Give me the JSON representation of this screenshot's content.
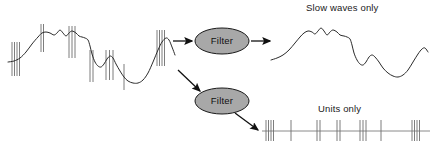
{
  "figure": {
    "width": 434,
    "height": 150,
    "background": "#ffffff",
    "title": ""
  },
  "colors": {
    "trace": "#2b2b2b",
    "spike": "#6e6e6e",
    "ellipse_fill": "#a8a8a8",
    "ellipse_stroke": "#1a1a1a",
    "arrow": "#111111",
    "text": "#1a1a1a",
    "baseline": "#8a8a8a"
  },
  "labels": {
    "slow_waves": "Slow waves only",
    "units": "Units only"
  },
  "nodes": [
    {
      "id": "filter-top",
      "label": "Filter",
      "cx": 222,
      "cy": 41,
      "rx": 27,
      "ry": 13
    },
    {
      "id": "filter-bottom",
      "label": "Filter",
      "cx": 222,
      "cy": 101,
      "rx": 27,
      "ry": 13
    }
  ],
  "arrows": [
    {
      "id": "input-to-filter-top",
      "x1": 173,
      "y1": 41,
      "x2": 192,
      "y2": 41
    },
    {
      "id": "filter-top-to-slow-waves",
      "x1": 251,
      "y1": 41,
      "x2": 270,
      "y2": 41
    },
    {
      "id": "input-to-filter-bottom",
      "x1": 178,
      "y1": 70,
      "x2": 200,
      "y2": 91
    },
    {
      "id": "filter-bottom-to-units",
      "x1": 235,
      "y1": 113,
      "x2": 258,
      "y2": 130
    }
  ],
  "chart_data": {
    "type": "line",
    "xlabel": "",
    "ylabel": "",
    "grid": false,
    "legend": "none",
    "panels": [
      {
        "id": "raw-signal",
        "name": "Raw signal (slow waves + units)",
        "x_range": [
          8,
          176
        ],
        "y_range": [
          18,
          90
        ],
        "trace_points": [
          [
            8,
            62
          ],
          [
            14,
            61
          ],
          [
            20,
            58
          ],
          [
            26,
            52
          ],
          [
            32,
            44
          ],
          [
            38,
            37
          ],
          [
            42,
            33
          ],
          [
            46,
            32
          ],
          [
            50,
            33
          ],
          [
            54,
            35
          ],
          [
            57,
            33
          ],
          [
            60,
            30
          ],
          [
            63,
            33
          ],
          [
            66,
            36
          ],
          [
            69,
            33
          ],
          [
            72,
            31
          ],
          [
            76,
            33
          ],
          [
            79,
            36
          ],
          [
            82,
            37
          ],
          [
            85,
            38
          ],
          [
            88,
            40
          ],
          [
            90,
            46
          ],
          [
            92,
            54
          ],
          [
            95,
            62
          ],
          [
            98,
            66
          ],
          [
            101,
            67
          ],
          [
            104,
            64
          ],
          [
            107,
            59
          ],
          [
            110,
            56
          ],
          [
            113,
            58
          ],
          [
            116,
            64
          ],
          [
            120,
            71
          ],
          [
            124,
            77
          ],
          [
            128,
            81
          ],
          [
            133,
            83
          ],
          [
            138,
            83
          ],
          [
            143,
            80
          ],
          [
            148,
            73
          ],
          [
            153,
            62
          ],
          [
            158,
            50
          ],
          [
            162,
            42
          ],
          [
            166,
            38
          ],
          [
            169,
            40
          ],
          [
            172,
            47
          ],
          [
            175,
            55
          ]
        ],
        "spike_bursts": [
          {
            "x": 12,
            "count": 4,
            "spacing": 2.5,
            "top": 42,
            "bottom": 76
          },
          {
            "x": 41,
            "count": 2,
            "spacing": 2.5,
            "top": 24,
            "bottom": 52
          },
          {
            "x": 69,
            "count": 3,
            "spacing": 3.0,
            "top": 26,
            "bottom": 58
          },
          {
            "x": 90,
            "count": 2,
            "spacing": 3.0,
            "top": 50,
            "bottom": 82
          },
          {
            "x": 106,
            "count": 3,
            "spacing": 3.5,
            "top": 50,
            "bottom": 80
          },
          {
            "x": 124,
            "count": 1,
            "spacing": 0,
            "top": 64,
            "bottom": 90
          },
          {
            "x": 157,
            "count": 4,
            "spacing": 2.5,
            "top": 30,
            "bottom": 66
          }
        ]
      },
      {
        "id": "slow-waves-output",
        "name": "Slow waves only",
        "x_range": [
          271,
          428
        ],
        "y_range": [
          22,
          76
        ],
        "trace_points": [
          [
            271,
            60
          ],
          [
            277,
            58
          ],
          [
            283,
            55
          ],
          [
            289,
            50
          ],
          [
            295,
            43
          ],
          [
            300,
            37
          ],
          [
            304,
            33
          ],
          [
            308,
            31
          ],
          [
            312,
            32
          ],
          [
            315,
            34
          ],
          [
            318,
            31
          ],
          [
            321,
            28
          ],
          [
            324,
            31
          ],
          [
            327,
            35
          ],
          [
            330,
            32
          ],
          [
            333,
            30
          ],
          [
            337,
            32
          ],
          [
            340,
            35
          ],
          [
            344,
            36
          ],
          [
            347,
            37
          ],
          [
            350,
            39
          ],
          [
            352,
            45
          ],
          [
            354,
            53
          ],
          [
            357,
            60
          ],
          [
            360,
            64
          ],
          [
            363,
            65
          ],
          [
            366,
            62
          ],
          [
            369,
            57
          ],
          [
            372,
            55
          ],
          [
            375,
            57
          ],
          [
            379,
            62
          ],
          [
            383,
            68
          ],
          [
            388,
            73
          ],
          [
            393,
            76
          ],
          [
            398,
            77
          ],
          [
            403,
            75
          ],
          [
            408,
            70
          ],
          [
            413,
            62
          ],
          [
            418,
            54
          ],
          [
            422,
            49
          ],
          [
            425,
            48
          ],
          [
            428,
            52
          ]
        ],
        "spike_bursts": []
      },
      {
        "id": "units-output",
        "name": "Units only",
        "baseline_y": 131,
        "x_range": [
          262,
          430
        ],
        "spike_bursts": [
          {
            "x": 266,
            "count": 4,
            "spacing": 2.5,
            "top": 120,
            "bottom": 141
          },
          {
            "x": 291,
            "count": 1,
            "spacing": 0,
            "top": 120,
            "bottom": 141
          },
          {
            "x": 317,
            "count": 2,
            "spacing": 3.0,
            "top": 120,
            "bottom": 141
          },
          {
            "x": 337,
            "count": 2,
            "spacing": 3.0,
            "top": 120,
            "bottom": 141
          },
          {
            "x": 360,
            "count": 3,
            "spacing": 3.0,
            "top": 120,
            "bottom": 141
          },
          {
            "x": 381,
            "count": 1,
            "spacing": 0,
            "top": 120,
            "bottom": 141
          },
          {
            "x": 412,
            "count": 4,
            "spacing": 2.5,
            "top": 120,
            "bottom": 141
          }
        ]
      }
    ]
  }
}
